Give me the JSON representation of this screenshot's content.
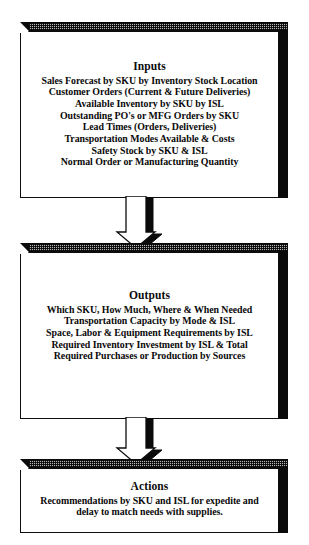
{
  "diagram": {
    "type": "flowchart",
    "orientation": "vertical",
    "colors": {
      "box_fill": "#ffffff",
      "box_outline": "#0d0d0d",
      "shadow": "#0a0a0a",
      "top_bevel": "#b4b4b4",
      "text": "#0a0a0a"
    },
    "boxes": [
      {
        "id": "inputs",
        "title": "Inputs",
        "lines": [
          "Sales Forecast by SKU by Inventory Stock Location",
          "Customer Orders (Current & Future Deliveries)",
          "Available Inventory by SKU by ISL",
          "Outstanding PO's or MFG Orders by SKU",
          "Lead Times (Orders, Deliveries)",
          "Transportation Modes Available & Costs",
          "Safety Stock by SKU & ISL",
          "Normal Order or Manufacturing Quantity"
        ]
      },
      {
        "id": "outputs",
        "title": "Outputs",
        "lines": [
          "Which SKU, How Much, Where & When Needed",
          "Transportation Capacity by Mode & ISL",
          "Space, Labor & Equipment Requirements by ISL",
          "Required Inventory Investment by ISL & Total",
          "Required Purchases or Production by Sources"
        ]
      },
      {
        "id": "actions",
        "title": "Actions",
        "lines": [
          "Recommendations by SKU and ISL for expedite and",
          "delay to match needs with supplies."
        ]
      }
    ],
    "connectors": [
      {
        "id": "inputs-to-outputs",
        "icon": "down-arrow-icon",
        "from": "inputs",
        "to": "outputs"
      },
      {
        "id": "outputs-to-actions",
        "icon": "down-arrow-icon",
        "from": "outputs",
        "to": "actions"
      }
    ]
  }
}
